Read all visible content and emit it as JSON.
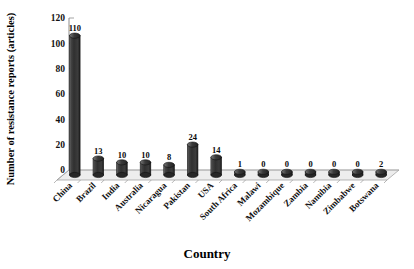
{
  "chart_data": {
    "type": "bar",
    "title": "",
    "xlabel": "Country",
    "ylabel": "Number of resistance reports (articles)",
    "categories": [
      "China",
      "Brazil",
      "India",
      "Australia",
      "Nicaragua",
      "Pakistan",
      "USA",
      "South Africa",
      "Malawi",
      "Mozambique",
      "Zambia",
      "Namibia",
      "Zimbabwe",
      "Botswana"
    ],
    "values": [
      110,
      13,
      10,
      10,
      8,
      24,
      14,
      1,
      0,
      0,
      0,
      0,
      0,
      2
    ],
    "value_labels": [
      "110",
      "13",
      "10",
      "10",
      "8",
      "24",
      "14",
      "1",
      "0",
      "0",
      "0",
      "0",
      "0",
      "2"
    ],
    "ylim": [
      0,
      120
    ],
    "yticks": [
      0,
      20,
      40,
      60,
      80,
      100,
      120
    ],
    "ytick_labels": [
      "0",
      "20",
      "40",
      "60",
      "80",
      "100",
      "120"
    ],
    "grid": false,
    "legend": "none",
    "style": "3d-cylinder",
    "bar_color": "#3a3a3a",
    "bar_highlight_color": "#8a8a8a",
    "bar_edge_color": "#111111",
    "floor_color": "#ededed",
    "axis_color": "#7a7a7a",
    "background": "#ffffff"
  }
}
